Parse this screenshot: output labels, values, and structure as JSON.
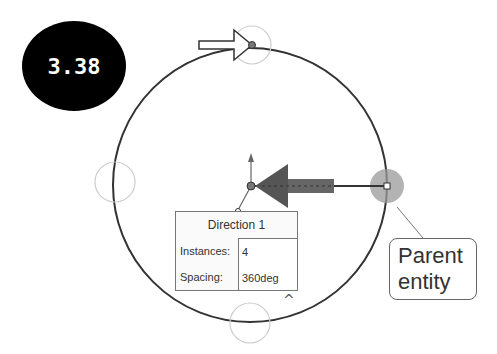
{
  "badge": {
    "label": "3.38"
  },
  "pattern_dialog": {
    "title": "Direction 1",
    "rows": [
      {
        "label": "Instances:",
        "value": "4"
      },
      {
        "label": "Spacing:",
        "value": "360deg"
      }
    ]
  },
  "callout": {
    "line1": "Parent",
    "line2": "entity"
  },
  "collapse_glyph": "^",
  "colors": {
    "circle": "#333333",
    "ghost": "#cccccc",
    "arrow": "#555555",
    "parent_highlight": "#999999"
  }
}
